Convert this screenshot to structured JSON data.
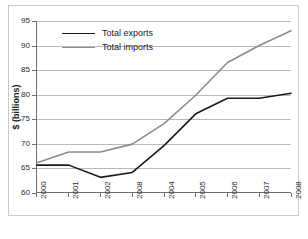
{
  "chart_data": {
    "type": "line",
    "title": "",
    "xlabel": "",
    "ylabel": "$ (billions)",
    "categories": [
      "2000",
      "2001",
      "2002",
      "2008",
      "2004",
      "2005",
      "2006",
      "2007",
      "2008"
    ],
    "ylim": [
      60,
      95
    ],
    "yticks": [
      60,
      65,
      70,
      75,
      80,
      85,
      90,
      95
    ],
    "grid": true,
    "legend_position": "top-left-inside",
    "series": [
      {
        "name": "Total exports",
        "color": "#1a1a1a",
        "values": [
          65.5,
          65.5,
          63.0,
          64.0,
          69.5,
          76.0,
          79.2,
          79.2,
          80.2
        ]
      },
      {
        "name": "Total imports",
        "color": "#8c8c8c",
        "values": [
          66.0,
          68.2,
          68.2,
          69.8,
          74.0,
          79.8,
          86.5,
          90.0,
          93.0
        ]
      }
    ]
  },
  "axis": {
    "y_title": "$ (billions)",
    "y_tick_labels": [
      "95",
      "90",
      "85",
      "80",
      "75",
      "70",
      "65",
      "60"
    ],
    "x_tick_labels": [
      "2000",
      "2001",
      "2002",
      "2008",
      "2004",
      "2005",
      "2006",
      "2007",
      "2008"
    ]
  },
  "legend": {
    "entries": [
      {
        "label": "Total exports",
        "color": "#1a1a1a"
      },
      {
        "label": "Total imports",
        "color": "#8c8c8c"
      }
    ]
  },
  "colors": {
    "exports_line": "#1a1a1a",
    "imports_line": "#8c8c8c",
    "gridline": "#b9b9b9",
    "axis": "#6f6f6f",
    "frame": "#c9c9c9",
    "background": "#ffffff",
    "text": "#1a1a1a"
  }
}
